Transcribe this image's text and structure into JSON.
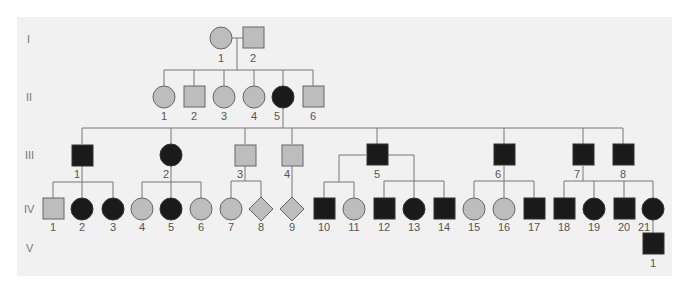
{
  "colors": {
    "affected": "#1a1a1a",
    "unaffected": "#bdbdbd",
    "stroke": "#666666",
    "line": "#777777",
    "background": "#f1f1f1"
  },
  "generations": [
    "I",
    "II",
    "III",
    "IV",
    "V"
  ],
  "individuals": {
    "I": [
      {
        "id": "1",
        "sex": "female",
        "affected": false
      },
      {
        "id": "2",
        "sex": "male",
        "affected": false
      }
    ],
    "II": [
      {
        "id": "1",
        "sex": "female",
        "affected": false
      },
      {
        "id": "2",
        "sex": "male",
        "affected": false
      },
      {
        "id": "3",
        "sex": "female",
        "affected": false
      },
      {
        "id": "4",
        "sex": "female",
        "affected": false
      },
      {
        "id": "5",
        "sex": "female",
        "affected": true
      },
      {
        "id": "6",
        "sex": "male",
        "affected": false
      }
    ],
    "III": [
      {
        "id": "1",
        "sex": "male",
        "affected": true
      },
      {
        "id": "2",
        "sex": "female",
        "affected": true
      },
      {
        "id": "3",
        "sex": "male",
        "affected": false
      },
      {
        "id": "4",
        "sex": "male",
        "affected": false
      },
      {
        "id": "5",
        "sex": "male",
        "affected": true
      },
      {
        "id": "6",
        "sex": "male",
        "affected": true
      },
      {
        "id": "7",
        "sex": "male",
        "affected": true
      },
      {
        "id": "8",
        "sex": "male",
        "affected": true
      }
    ],
    "IV": [
      {
        "id": "1",
        "sex": "male",
        "affected": false
      },
      {
        "id": "2",
        "sex": "female",
        "affected": true
      },
      {
        "id": "3",
        "sex": "female",
        "affected": true
      },
      {
        "id": "4",
        "sex": "female",
        "affected": false
      },
      {
        "id": "5",
        "sex": "female",
        "affected": true
      },
      {
        "id": "6",
        "sex": "female",
        "affected": false
      },
      {
        "id": "7",
        "sex": "female",
        "affected": false
      },
      {
        "id": "8",
        "sex": "unknown",
        "affected": false
      },
      {
        "id": "9",
        "sex": "unknown",
        "affected": false
      },
      {
        "id": "10",
        "sex": "male",
        "affected": true
      },
      {
        "id": "11",
        "sex": "female",
        "affected": false
      },
      {
        "id": "12",
        "sex": "male",
        "affected": true
      },
      {
        "id": "13",
        "sex": "female",
        "affected": true
      },
      {
        "id": "14",
        "sex": "male",
        "affected": true
      },
      {
        "id": "15",
        "sex": "female",
        "affected": false
      },
      {
        "id": "16",
        "sex": "female",
        "affected": false
      },
      {
        "id": "17",
        "sex": "male",
        "affected": true
      },
      {
        "id": "18",
        "sex": "male",
        "affected": true
      },
      {
        "id": "19",
        "sex": "female",
        "affected": true
      },
      {
        "id": "20",
        "sex": "male",
        "affected": true
      },
      {
        "id": "21",
        "sex": "female",
        "affected": true
      }
    ],
    "V": [
      {
        "id": "1",
        "sex": "male",
        "affected": true
      }
    ]
  }
}
